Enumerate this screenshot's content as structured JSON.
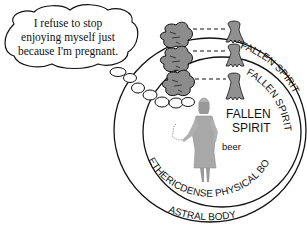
{
  "thought_bubble": {
    "lines": [
      "I refuse to stop",
      "enjoying myself just",
      "because I'm pregnant."
    ]
  },
  "rings": {
    "outer_label": "ASTRAL BODY",
    "inner_label": "ETHERICDENSE PHYSICAL BODY",
    "fallen_spirit_outer": "FALLEN SPIRIT",
    "fallen_spirit_middle": "FALLEN SPIRIT"
  },
  "labels": {
    "fallen": "FALLEN",
    "spirit": "SPIRIT",
    "beer": "beer"
  },
  "colors": {
    "line": "#111111",
    "blob_fill": "#8c8c8c",
    "spirit_fill": "#909090",
    "figure_fill": "#a8a8a8"
  }
}
